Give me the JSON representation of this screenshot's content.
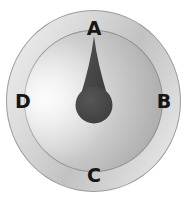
{
  "figure": {
    "name": "gauge-dial-diagram",
    "background_color": "#ffffff"
  },
  "dial": {
    "outer_ring": {
      "label": "outer-bezel-ring",
      "border_color": "#9a9a9a",
      "fill_light": "#efefef",
      "fill_dark": "#c2c2c2"
    },
    "inner_face": {
      "label": "inner-dial-face",
      "border_color": "#8f8f8f",
      "fill_light": "#f3f3f3",
      "fill_dark": "#9a9a9a"
    },
    "needle": {
      "label": "dial-needle",
      "shape": "teardrop",
      "color": "#4a4a4a",
      "points_to": "A",
      "angle_degrees": 0
    },
    "hub": {
      "label": "needle-hub",
      "color": "#474747",
      "radius_px": 18
    }
  },
  "labels": {
    "top": "A",
    "right": "B",
    "bottom": "C",
    "left": "D",
    "color": "#161616"
  }
}
